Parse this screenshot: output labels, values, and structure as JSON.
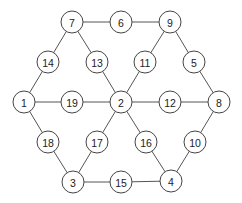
{
  "diagram": {
    "type": "graph",
    "node_radius": 11,
    "nodes": [
      {
        "id": "n7",
        "label": "7",
        "x": 72,
        "y": 22
      },
      {
        "id": "n6",
        "label": "6",
        "x": 121,
        "y": 22
      },
      {
        "id": "n9",
        "label": "9",
        "x": 170,
        "y": 22
      },
      {
        "id": "n14",
        "label": "14",
        "x": 48,
        "y": 62
      },
      {
        "id": "n13",
        "label": "13",
        "x": 97,
        "y": 62
      },
      {
        "id": "n11",
        "label": "11",
        "x": 145,
        "y": 62
      },
      {
        "id": "n5",
        "label": "5",
        "x": 194,
        "y": 62
      },
      {
        "id": "n1",
        "label": "1",
        "x": 24,
        "y": 102
      },
      {
        "id": "n19",
        "label": "19",
        "x": 72,
        "y": 102
      },
      {
        "id": "n2",
        "label": "2",
        "x": 121,
        "y": 102
      },
      {
        "id": "n12",
        "label": "12",
        "x": 170,
        "y": 102
      },
      {
        "id": "n8",
        "label": "8",
        "x": 219,
        "y": 102
      },
      {
        "id": "n18",
        "label": "18",
        "x": 48,
        "y": 142
      },
      {
        "id": "n17",
        "label": "17",
        "x": 97,
        "y": 142
      },
      {
        "id": "n16",
        "label": "16",
        "x": 146,
        "y": 142
      },
      {
        "id": "n10",
        "label": "10",
        "x": 195,
        "y": 142
      },
      {
        "id": "n3",
        "label": "3",
        "x": 73,
        "y": 182
      },
      {
        "id": "n15",
        "label": "15",
        "x": 121,
        "y": 182
      },
      {
        "id": "n4",
        "label": "4",
        "x": 171,
        "y": 181
      }
    ],
    "edges": [
      [
        "n7",
        "n6"
      ],
      [
        "n6",
        "n9"
      ],
      [
        "n7",
        "n14"
      ],
      [
        "n14",
        "n1"
      ],
      [
        "n7",
        "n13"
      ],
      [
        "n13",
        "n2"
      ],
      [
        "n9",
        "n11"
      ],
      [
        "n11",
        "n2"
      ],
      [
        "n9",
        "n5"
      ],
      [
        "n5",
        "n8"
      ],
      [
        "n1",
        "n19"
      ],
      [
        "n19",
        "n2"
      ],
      [
        "n2",
        "n12"
      ],
      [
        "n12",
        "n8"
      ],
      [
        "n1",
        "n18"
      ],
      [
        "n18",
        "n3"
      ],
      [
        "n2",
        "n17"
      ],
      [
        "n17",
        "n3"
      ],
      [
        "n2",
        "n16"
      ],
      [
        "n16",
        "n4"
      ],
      [
        "n8",
        "n10"
      ],
      [
        "n10",
        "n4"
      ],
      [
        "n3",
        "n15"
      ],
      [
        "n15",
        "n4"
      ]
    ]
  }
}
